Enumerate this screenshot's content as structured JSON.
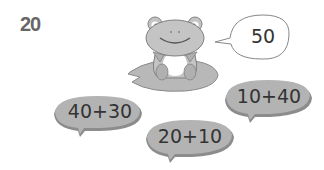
{
  "question": {
    "number": "20"
  },
  "speech_bubble": {
    "value": "50"
  },
  "lily_pads": [
    {
      "expression": "40+30"
    },
    {
      "expression": "20+10"
    },
    {
      "expression": "10+40"
    }
  ],
  "colors": {
    "pad_fill": "#b3b3b3",
    "pad_shadow": "#8c8c8c",
    "frog_fill": "#c4c4c4",
    "frog_outline": "#808080",
    "belly": "#ffffff",
    "text": "#333333",
    "number": "#666666"
  }
}
